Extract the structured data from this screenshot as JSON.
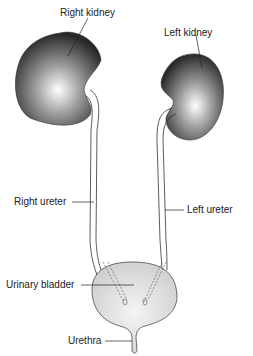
{
  "diagram": {
    "labels": {
      "right_kidney": "Right kidney",
      "left_kidney": "Left kidney",
      "right_ureter": "Right ureter",
      "left_ureter": "Left ureter",
      "urinary_bladder": "Urinary bladder",
      "urethra": "Urethra"
    },
    "colors": {
      "kidney_dark": "#2a2a2a",
      "kidney_light": "#ffffff",
      "bladder_fill": "#dcdcdc",
      "outline": "#333333"
    }
  }
}
